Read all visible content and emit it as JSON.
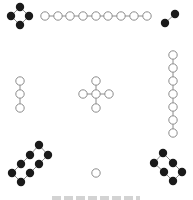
{
  "diagram": {
    "colors": {
      "black_dot": "#1a1a1a",
      "white_dot_fill": "#ffffff",
      "white_dot_stroke": "#8c8c8c",
      "line": "#8c8c8c"
    },
    "dot_radius": 4.2,
    "groups": [
      {
        "name": "top-left-4-black",
        "count": 4,
        "color": "black",
        "dots": [
          [
            20,
            7
          ],
          [
            11,
            16
          ],
          [
            29,
            16
          ],
          [
            20,
            25
          ]
        ],
        "links": [
          [
            0,
            1
          ],
          [
            0,
            2
          ],
          [
            1,
            3
          ],
          [
            2,
            3
          ]
        ]
      },
      {
        "name": "top-9-white",
        "count": 9,
        "color": "white",
        "dots": [
          [
            45,
            16
          ],
          [
            58,
            16
          ],
          [
            70,
            16
          ],
          [
            83,
            16
          ],
          [
            96,
            16
          ],
          [
            108,
            16
          ],
          [
            121,
            16
          ],
          [
            134,
            16
          ],
          [
            147,
            16
          ]
        ],
        "links": [
          [
            0,
            1
          ],
          [
            1,
            2
          ],
          [
            2,
            3
          ],
          [
            3,
            4
          ],
          [
            4,
            5
          ],
          [
            5,
            6
          ],
          [
            6,
            7
          ],
          [
            7,
            8
          ]
        ]
      },
      {
        "name": "top-right-2-black",
        "count": 2,
        "color": "black",
        "dots": [
          [
            175,
            14
          ],
          [
            165,
            23
          ]
        ],
        "links": [
          [
            0,
            1
          ]
        ]
      },
      {
        "name": "left-3-white",
        "count": 3,
        "color": "white",
        "dots": [
          [
            20,
            81
          ],
          [
            20,
            94
          ],
          [
            20,
            108
          ]
        ],
        "links": [
          [
            0,
            1
          ],
          [
            1,
            2
          ]
        ]
      },
      {
        "name": "center-5-white",
        "count": 5,
        "color": "white",
        "dots": [
          [
            96,
            94
          ],
          [
            96,
            81
          ],
          [
            96,
            108
          ],
          [
            83,
            94
          ],
          [
            109,
            94
          ]
        ],
        "links": [
          [
            0,
            1
          ],
          [
            0,
            2
          ],
          [
            0,
            3
          ],
          [
            0,
            4
          ]
        ]
      },
      {
        "name": "right-7-white",
        "count": 7,
        "color": "white",
        "dots": [
          [
            173,
            55
          ],
          [
            173,
            68
          ],
          [
            173,
            81
          ],
          [
            173,
            94
          ],
          [
            173,
            107
          ],
          [
            173,
            120
          ],
          [
            173,
            133
          ]
        ],
        "links": [
          [
            0,
            1
          ],
          [
            1,
            2
          ],
          [
            2,
            3
          ],
          [
            3,
            4
          ],
          [
            4,
            5
          ],
          [
            5,
            6
          ]
        ]
      },
      {
        "name": "bottom-left-8-black",
        "count": 8,
        "color": "black",
        "dots": [
          [
            39,
            145
          ],
          [
            30,
            155
          ],
          [
            21,
            164
          ],
          [
            12,
            173
          ],
          [
            48,
            155
          ],
          [
            39,
            164
          ],
          [
            30,
            173
          ],
          [
            21,
            182
          ]
        ],
        "links": [
          [
            0,
            1
          ],
          [
            1,
            2
          ],
          [
            2,
            3
          ],
          [
            4,
            5
          ],
          [
            5,
            6
          ],
          [
            6,
            7
          ],
          [
            0,
            4
          ],
          [
            3,
            7
          ]
        ]
      },
      {
        "name": "bottom-1-white",
        "count": 1,
        "color": "white",
        "dots": [
          [
            96,
            173
          ]
        ],
        "links": []
      },
      {
        "name": "bottom-right-6-black",
        "count": 6,
        "color": "black",
        "dots": [
          [
            163,
            153
          ],
          [
            154,
            163
          ],
          [
            173,
            163
          ],
          [
            164,
            172
          ],
          [
            182,
            172
          ],
          [
            173,
            181
          ]
        ],
        "links": [
          [
            0,
            1
          ],
          [
            0,
            2
          ],
          [
            1,
            3
          ],
          [
            2,
            4
          ],
          [
            3,
            5
          ],
          [
            4,
            5
          ]
        ]
      }
    ]
  },
  "caption": {
    "text": ""
  }
}
